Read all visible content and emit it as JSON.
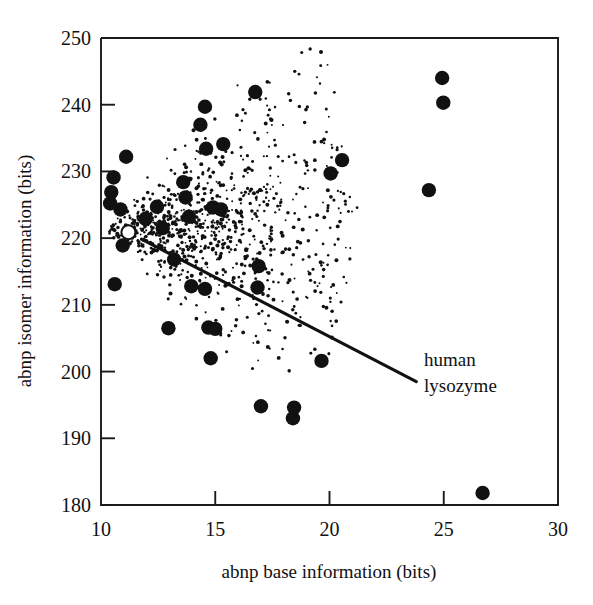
{
  "chart_data": {
    "type": "scatter",
    "title": "",
    "xlabel": "abnp base information (bits)",
    "ylabel": "abnp isomer information (bits)",
    "xlim": [
      10,
      30
    ],
    "ylim": [
      180,
      250
    ],
    "xticks": [
      10,
      15,
      20,
      25,
      30
    ],
    "yticks": [
      180,
      190,
      200,
      210,
      220,
      230,
      240,
      250
    ],
    "xtick_labels": [
      "10",
      "15",
      "20",
      "25",
      "30"
    ],
    "ytick_labels": [
      "180",
      "190",
      "200",
      "210",
      "220",
      "230",
      "240",
      "250"
    ],
    "grid": false,
    "legend": "none",
    "annotations": [
      {
        "label_line1": "human",
        "label_line2": "lysozyme",
        "points_to_x": 11.2,
        "points_to_y": 220.9,
        "leader_from_x": 23.8,
        "leader_from_y": 198.5
      }
    ],
    "series": [
      {
        "name": "highlighted species (large filled circles)",
        "marker": "filled-circle",
        "marker_size": 11,
        "points": [
          [
            16.75,
            241.9
          ],
          [
            14.55,
            239.7
          ],
          [
            24.93,
            244.0
          ],
          [
            24.98,
            240.3
          ],
          [
            14.35,
            237.0
          ],
          [
            15.35,
            234.1
          ],
          [
            20.55,
            231.7
          ],
          [
            14.6,
            233.4
          ],
          [
            11.1,
            232.2
          ],
          [
            20.05,
            229.7
          ],
          [
            10.55,
            229.1
          ],
          [
            13.6,
            228.4
          ],
          [
            10.45,
            226.9
          ],
          [
            24.35,
            227.2
          ],
          [
            13.7,
            226.1
          ],
          [
            10.4,
            225.2
          ],
          [
            12.45,
            224.7
          ],
          [
            10.85,
            224.3
          ],
          [
            14.9,
            224.6
          ],
          [
            15.25,
            224.3
          ],
          [
            11.95,
            222.9
          ],
          [
            13.85,
            223.2
          ],
          [
            11.25,
            220.9
          ],
          [
            12.7,
            221.5
          ],
          [
            10.95,
            218.9
          ],
          [
            16.9,
            215.8
          ],
          [
            13.2,
            216.8
          ],
          [
            10.6,
            213.1
          ],
          [
            13.95,
            212.8
          ],
          [
            14.55,
            212.4
          ],
          [
            16.85,
            212.6
          ],
          [
            12.95,
            206.5
          ],
          [
            14.7,
            206.6
          ],
          [
            15.0,
            206.4
          ],
          [
            14.8,
            202.0
          ],
          [
            19.65,
            201.6
          ],
          [
            17.0,
            194.8
          ],
          [
            18.45,
            194.6
          ],
          [
            18.4,
            193.0
          ],
          [
            26.7,
            181.8
          ]
        ]
      },
      {
        "name": "background distribution (small dots)",
        "marker": "small-dot",
        "marker_size": 1.6,
        "description": "dense teardrop-shaped cloud of ~900 small dots fanning rightward from near (10.3, 221), widest near x=12-14, tapering out past x=20"
      }
    ]
  },
  "axes": {
    "x_label": "abnp base information (bits)",
    "y_label": "abnp isomer information (bits)",
    "x_tick_labels": [
      "10",
      "15",
      "20",
      "25",
      "30"
    ],
    "y_tick_labels": [
      "250",
      "240",
      "230",
      "220",
      "210",
      "200",
      "190",
      "180"
    ]
  },
  "annotation": {
    "line1": "human",
    "line2": "lysozyme"
  },
  "colors": {
    "ink": "#111111",
    "background": "#ffffff"
  }
}
